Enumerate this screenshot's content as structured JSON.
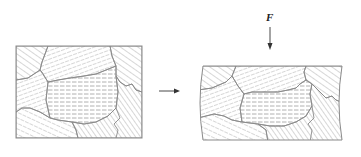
{
  "diagram": {
    "before": {
      "name": "undeformed-grains",
      "grain_count": 7
    },
    "transition_arrow": {
      "direction": "right"
    },
    "after": {
      "name": "compressed-grains",
      "grain_count": 7
    },
    "force": {
      "label": "F",
      "direction": "down"
    }
  },
  "colors": {
    "outline": "#8a8a8a",
    "hatch": "#9a9a9a",
    "arrow": "#333333",
    "background": "#ffffff"
  }
}
